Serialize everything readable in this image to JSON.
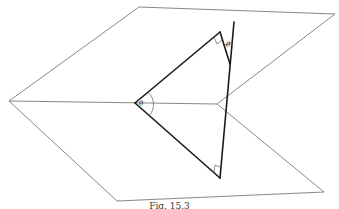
{
  "figure": {
    "caption": "Fig. 15.3",
    "labels": {
      "angle_left": "θ",
      "angle_top": "θ"
    },
    "elements": {
      "upper_plane": "parallelogram plane (upper)",
      "lower_plane": "parallelogram plane (lower)",
      "triangle": "right-angled triangle with angle θ at intersection line",
      "normal_line": "line through triangle apex, inclined at θ"
    },
    "right_angle_marks": 2
  }
}
